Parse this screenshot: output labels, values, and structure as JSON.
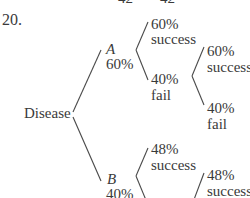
{
  "problem_number": "20.",
  "top_cut_text": [
    "42",
    "42"
  ],
  "tree": {
    "root": "Disease",
    "branches": [
      {
        "name": "A",
        "probability": "60%",
        "children": [
          {
            "probability": "60%",
            "outcome": "success"
          },
          {
            "probability": "40%",
            "outcome": "fail",
            "children": [
              {
                "probability": "60%",
                "outcome": "success"
              },
              {
                "probability": "40%",
                "outcome": "fail"
              }
            ]
          }
        ]
      },
      {
        "name": "B",
        "probability": "40%",
        "children": [
          {
            "probability": "48%",
            "outcome": "success"
          },
          {
            "probability": "52%",
            "outcome": "fail",
            "children": [
              {
                "probability": "48%",
                "outcome": "success"
              }
            ]
          }
        ]
      }
    ]
  },
  "colors": {
    "ink": "#3a3a3a",
    "line": "#4a4a4a",
    "background": "#ffffff"
  }
}
